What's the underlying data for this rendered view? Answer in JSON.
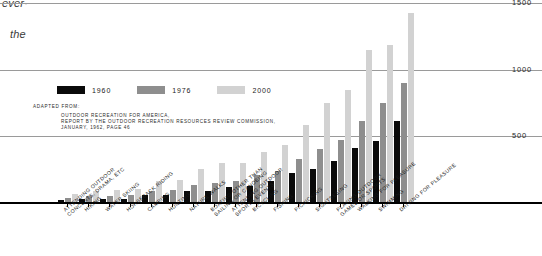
{
  "page_fragments": {
    "frag_top": "ever·",
    "frag_second": "the"
  },
  "legend": {
    "items": [
      {
        "label": "1960",
        "color": "#0a0a0a",
        "key": "s1960"
      },
      {
        "label": "1976",
        "color": "#8e8e8e",
        "key": "s1976"
      },
      {
        "label": "2000",
        "color": "#d2d2d2",
        "key": "s2000"
      }
    ]
  },
  "source": {
    "heading": "ADAPTED FROM:",
    "body": "OUTDOOR RECREATION FOR AMERICA,\nREPORT BY THE OUTDOOR RECREATION RESOURCES REVIEW COMMISSION,\nJANUARY, 1962, PAGE 46"
  },
  "chart_data": {
    "type": "bar",
    "title": "",
    "subtitle": "",
    "xlabel": "",
    "ylabel": "",
    "ylim": [
      0,
      1550
    ],
    "yticks": [
      500,
      1000,
      1500
    ],
    "ytick_labels": [
      "500",
      "1000",
      "1500"
    ],
    "grid": true,
    "legend_position": "upper-left",
    "categories": [
      "ATTENDING OUTDOOR\nCONCERTS, DRAMA, ETC",
      "HIKING",
      "WATER SKIING",
      "HORSEBACK RIDING",
      "CAMPING",
      "HUNTING",
      "NATURE WALKS",
      "BOATING OTHER THAN\nSAILING OR CANOEING",
      "ATTENDING OUTDOOR\nSPORTS EVENTS",
      "BICYCLING",
      "FISHING",
      "PICNICKING",
      "SIGHTSEEING",
      "PLAYING OUTDOOR\nGAMES OR SPORTS",
      "WALKING FOR PLEASURE",
      "SWIMMING",
      "DRIVING FOR PLEASURE"
    ],
    "series": [
      {
        "name": "1960",
        "color": "#0a0a0a",
        "values": [
          17,
          25,
          23,
          25,
          50,
          55,
          80,
          82,
          110,
          120,
          160,
          215,
          250,
          310,
          405,
          455,
          605
        ]
      },
      {
        "name": "1976",
        "color": "#8e8e8e",
        "values": [
          32,
          42,
          45,
          50,
          82,
          90,
          130,
          145,
          160,
          200,
          235,
          320,
          400,
          465,
          605,
          745,
          895
        ]
      },
      {
        "name": "2000",
        "color": "#d2d2d2",
        "values": [
          60,
          80,
          92,
          95,
          160,
          165,
          250,
          290,
          290,
          375,
          430,
          575,
          740,
          840,
          1140,
          1180,
          1420
        ]
      }
    ]
  }
}
